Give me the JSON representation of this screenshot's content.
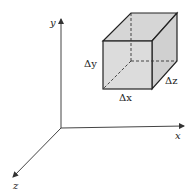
{
  "diagram": {
    "type": "3d-coordinate-volume-element",
    "axes": {
      "x_label": "x",
      "y_label": "y",
      "z_label": "z"
    },
    "cube": {
      "dx_label": "Δx",
      "dy_label": "Δy",
      "dz_label": "Δz",
      "fill_color": "#d6d6d6",
      "edge_color": "#222222"
    }
  }
}
